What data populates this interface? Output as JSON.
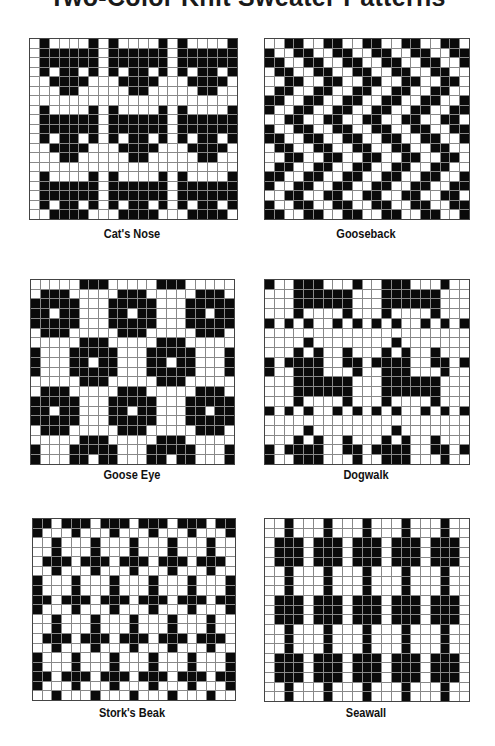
{
  "document": {
    "title": "Two-Color Knit Sweater Patterns"
  },
  "patterns": [
    {
      "name": "Cat's Nose",
      "cols": 21,
      "rows": 19,
      "box": {
        "x": 29,
        "y": 38,
        "w": 207,
        "h": 180
      },
      "label_y": 227,
      "label_x": 22,
      "tile": [
        "WBWWWWB",
        "WBBBBBB",
        "WBBBBBB",
        "WBWBBWB",
        "WWBBBBW",
        "WWWBBWW",
        "WWWWWWW"
      ]
    },
    {
      "name": "Gooseback",
      "cols": 21,
      "rows": 19,
      "box": {
        "x": 264,
        "y": 38,
        "w": 204,
        "h": 180
      },
      "label_y": 227,
      "label_x": 256,
      "tile": [
        "WWBB",
        "BWWB",
        "BBWW",
        "WBBW",
        "WWBB",
        "WBBW",
        "BBWW",
        "BWWB"
      ]
    },
    {
      "name": "Goose Eye",
      "cols": 21,
      "rows": 19,
      "box": {
        "x": 30,
        "y": 279,
        "w": 203,
        "h": 184
      },
      "label_y": 468,
      "label_x": 22,
      "tile": [
        "WWWWWBBB",
        "WBBBWWWW",
        "BBBBBWWW",
        "BBWBBWWW",
        "BBBBBWWW",
        "WBBBWWWW",
        "WWWWWBBB",
        "BWWWBBBB",
        "BWWWBBWB",
        "BWWWBBBB"
      ]
    },
    {
      "name": "Dogwalk",
      "cols": 21,
      "rows": 19,
      "box": {
        "x": 264,
        "y": 279,
        "w": 204,
        "h": 184
      },
      "label_y": 468,
      "label_x": 256,
      "tile": [
        "BWWBBBWWW",
        "WWWBBBBBB",
        "WWWBBBBBB",
        "WWWBWWWWB",
        "BWBWBWWBW",
        "WWWWWWWWW",
        "WWWWBWWWW",
        "WWWBWBWWB",
        "BWBBBBWWB"
      ]
    },
    {
      "name": "Stork's Beak",
      "cols": 21,
      "rows": 19,
      "box": {
        "x": 32,
        "y": 518,
        "w": 202,
        "h": 181
      },
      "label_y": 706,
      "label_x": 22,
      "tile": [
        "BBWB",
        "BWWW",
        "WWBW",
        "WWBW",
        "WBBB",
        "WWBW",
        "BWWW",
        "BWWW"
      ]
    },
    {
      "name": "Seawall",
      "cols": 21,
      "rows": 19,
      "box": {
        "x": 264,
        "y": 518,
        "w": 204,
        "h": 182
      },
      "label_y": 706,
      "label_x": 256,
      "rows_explicit": [
        "WWBW",
        "WWBW",
        "WBBB",
        "WBBB",
        "WBBB",
        "WWBW",
        "WWBW",
        "WWBW",
        "WBBB",
        "WBBB",
        "WBBB",
        "WWBW",
        "WWBW",
        "WWBW",
        "WBBB",
        "WBBB",
        "WBBB",
        "WWBW",
        "WWBW"
      ]
    }
  ],
  "colors": {
    "knit_dark": "#0a0a0a",
    "knit_light": "#ffffff",
    "grid_line": "#888888"
  }
}
